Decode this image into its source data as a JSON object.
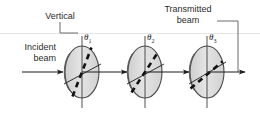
{
  "figure": {
    "name": "three-polarizer-diagram",
    "width": 260,
    "height": 123,
    "background": "#ffffff"
  },
  "labels": {
    "vertical": "Vertical",
    "incident_line1": "Incident",
    "incident_line2": "beam",
    "transmitted_line1": "Transmitted",
    "transmitted_line2": "beam",
    "theta1": "θ",
    "theta1_sub": "1",
    "theta2": "θ",
    "theta2_sub": "2",
    "theta3": "θ",
    "theta3_sub": "3"
  },
  "colors": {
    "ink": "#1c1c1c",
    "text": "#2b2b2b",
    "disc_fill": "#d4d4d4",
    "disc_face": "#dcdcdc",
    "disc_edge": "#bdbdbd",
    "disc_stroke": "#4a4a4a",
    "rule": "#e2e2e2",
    "leader": "#6b6b6b"
  },
  "polarizers": [
    {
      "id": "polarizer-1",
      "cx": 82,
      "cy": 72,
      "rx": 17,
      "ry": 26,
      "axis_angle_deg": 70,
      "label": "θ1"
    },
    {
      "id": "polarizer-2",
      "cx": 145,
      "cy": 72,
      "rx": 17,
      "ry": 26,
      "axis_angle_deg": 55,
      "label": "θ2"
    },
    {
      "id": "polarizer-3",
      "cx": 207,
      "cy": 72,
      "rx": 17,
      "ry": 26,
      "axis_angle_deg": 30,
      "label": "θ3"
    }
  ],
  "beam": {
    "incident_arrow": {
      "x1": 22,
      "y1": 72,
      "x2": 64,
      "y2": 72
    },
    "segment_1_2": {
      "x1": 100,
      "y1": 72,
      "x2": 128,
      "y2": 72
    },
    "segment_2_3": {
      "x1": 163,
      "y1": 72,
      "x2": 190,
      "y2": 72
    },
    "transmitted": {
      "x1": 224,
      "y1": 72,
      "x2": 244,
      "y2": 72
    }
  },
  "guides": {
    "horizontal_rule_y": 33,
    "vertical_label_leader": "L-shaped from label down then right to first polarizer axis",
    "transmitted_label_leader": "L-shaped from label right then down to transmitted arrow"
  }
}
